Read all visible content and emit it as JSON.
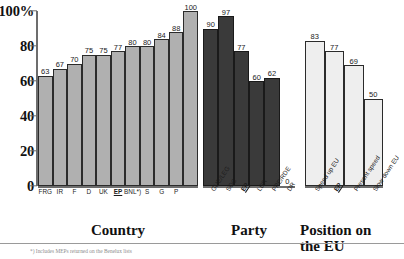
{
  "chart_data": {
    "type": "bar",
    "title": "",
    "xlabel": "",
    "ylabel": "",
    "ylim": [
      0,
      100
    ],
    "yticks": [
      0,
      20,
      40,
      60,
      80,
      100
    ],
    "ytick_labels": [
      "0",
      "20",
      "40",
      "60",
      "80",
      "100%"
    ],
    "grid": false,
    "legend": "none",
    "groups": [
      {
        "name": "Country",
        "title": "Country",
        "bar_style": "gray",
        "categories": [
          "FRG",
          "IR",
          "F",
          "D",
          "UK",
          "EP",
          "BNL*)",
          "S",
          "G",
          "P"
        ],
        "values": [
          63,
          67,
          70,
          75,
          75,
          77,
          80,
          80,
          84,
          88
        ],
        "extra_category": "",
        "highlight": "EP",
        "label_orientation": "horizontal"
      },
      {
        "name": "Party",
        "title": "Party",
        "bar_style": "dark",
        "categories": [
          "GUE/LEG",
          "SOC",
          "EP",
          "LDR",
          "PPE/RDE",
          "DR"
        ],
        "values": [
          90,
          97,
          77,
          60,
          62,
          0
        ],
        "highlight": "EP",
        "label_orientation": "rotated"
      },
      {
        "name": "Position on the EU",
        "title": "Position on\nthe EU",
        "bar_style": "light",
        "categories": [
          "Speed up EU",
          "EP",
          "Present speed",
          "Slow down EU"
        ],
        "values": [
          83,
          77,
          69,
          50
        ],
        "highlight": "EP",
        "label_orientation": "rotated"
      }
    ],
    "note": "The tenth Country bar is labelled 100 and reaches the top of the scale."
  },
  "axis": {
    "ytick_labels": [
      "100%",
      "80",
      "60",
      "40",
      "20",
      "0"
    ]
  },
  "country_group": {
    "title": "Country",
    "values": [
      "63",
      "67",
      "70",
      "75",
      "75",
      "77",
      "80",
      "80",
      "84",
      "88",
      "100"
    ],
    "categories": [
      "FRG",
      "IR",
      "F",
      "D",
      "UK",
      "EP",
      "BNL*)",
      "S",
      "G",
      "P"
    ]
  },
  "party_group": {
    "title": "Party",
    "values": [
      "90",
      "97",
      "77",
      "60",
      "62",
      "0"
    ],
    "categories": [
      "GUE/LEG",
      "SOC",
      "EP",
      "LDR",
      "PPE/RDE",
      "DR"
    ]
  },
  "eu_group": {
    "title": "Position on\nthe EU",
    "values": [
      "83",
      "77",
      "69",
      "50"
    ],
    "categories": [
      "Speed up EU",
      "EP",
      "Present speed",
      "Slow down EU"
    ]
  },
  "footnote": {
    "text": "*) Includes MEPs returned on the Benelux lists"
  }
}
